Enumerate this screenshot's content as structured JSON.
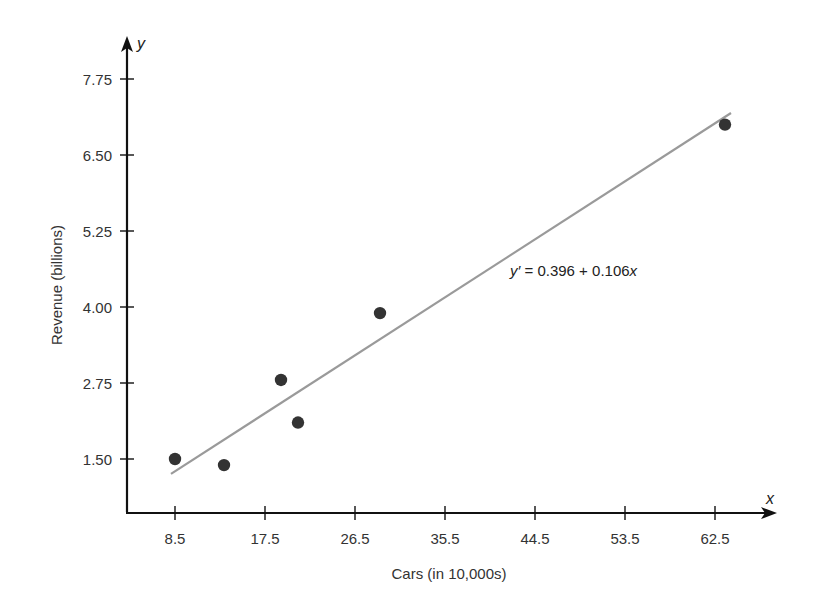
{
  "chart_data": {
    "type": "scatter",
    "title": "",
    "xlabel": "Cars (in 10,000s)",
    "ylabel": "Revenue (billions)",
    "x_axis_var": "x",
    "y_axis_var": "y",
    "x_ticks": [
      8.5,
      17.5,
      26.5,
      35.5,
      44.5,
      53.5,
      62.5
    ],
    "x_tick_labels": [
      "8.5",
      "17.5",
      "26.5",
      "35.5",
      "44.5",
      "53.5",
      "62.5"
    ],
    "y_ticks": [
      1.5,
      2.75,
      4.0,
      5.25,
      6.5,
      7.75
    ],
    "y_tick_labels": [
      "1.50",
      "2.75",
      "4.00",
      "5.25",
      "6.50",
      "7.75"
    ],
    "grid": false,
    "legend": null,
    "points": [
      {
        "x": 8.5,
        "y": 1.5
      },
      {
        "x": 13.4,
        "y": 1.4
      },
      {
        "x": 19.1,
        "y": 2.8
      },
      {
        "x": 20.8,
        "y": 2.1
      },
      {
        "x": 29.0,
        "y": 3.9
      },
      {
        "x": 63.5,
        "y": 7.0
      }
    ],
    "regression": {
      "intercept": 0.396,
      "slope": 0.106,
      "x_start": 8.1,
      "x_end": 64.1,
      "label": "y′ = 0.396 + 0.106x",
      "label_parts": {
        "lhs": "y′",
        "mid": " = 0.396 + 0.106",
        "var": "x"
      }
    },
    "colors": {
      "axis": "#111111",
      "points": "#333333",
      "line": "#9a9a9a",
      "text": "#333333"
    }
  }
}
